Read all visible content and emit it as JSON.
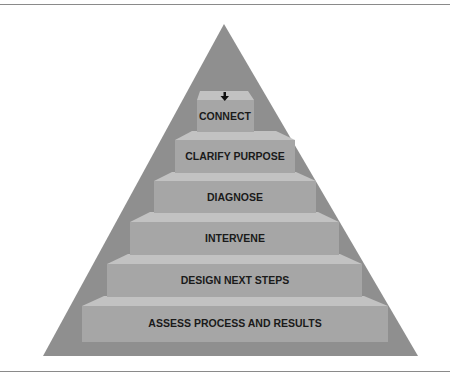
{
  "diagram": {
    "type": "pyramid-steps",
    "colors": {
      "pyramid": "#8f8f8f",
      "step_front": "#a6a6a6",
      "step_top": "#c2c2c2",
      "text": "#1a1a1a",
      "rule": "#8a8a8a"
    },
    "entry_arrow": "down-arrow-icon",
    "steps": [
      {
        "label": "CONNECT"
      },
      {
        "label": "CLARIFY PURPOSE"
      },
      {
        "label": "DIAGNOSE"
      },
      {
        "label": "INTERVENE"
      },
      {
        "label": "DESIGN NEXT STEPS"
      },
      {
        "label": "ASSESS PROCESS AND RESULTS"
      }
    ]
  }
}
